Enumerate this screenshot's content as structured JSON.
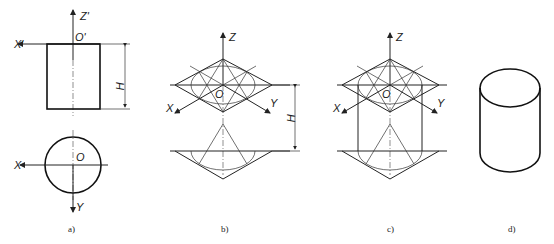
{
  "figure": {
    "panels": [
      {
        "id": "a",
        "caption": "a)",
        "labels": {
          "z_axis": "Z'",
          "x_axis_front": "X'",
          "origin_front": "O'",
          "height": "H",
          "x_axis_top": "X",
          "origin_top": "O",
          "y_axis": "Y"
        }
      },
      {
        "id": "b",
        "caption": "b)",
        "labels": {
          "z_axis": "Z",
          "origin": "O",
          "x_axis": "X",
          "y_axis": "Y",
          "height": "H"
        }
      },
      {
        "id": "c",
        "caption": "c)",
        "labels": {
          "z_axis": "Z",
          "origin": "O",
          "x_axis": "X",
          "y_axis": "Y"
        }
      },
      {
        "id": "d",
        "caption": "d)"
      }
    ]
  }
}
